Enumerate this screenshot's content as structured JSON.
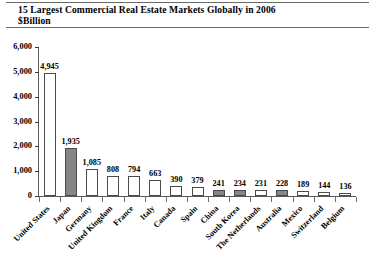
{
  "title": {
    "line1": "15 Largest Commercial Real Estate Markets Globally in 2006",
    "line2": "$Billion"
  },
  "colors": {
    "bar_white": "#ffffff",
    "bar_gray": "#868686",
    "axis": "#5a5a5a",
    "text": "#000000"
  },
  "chart_data": {
    "type": "bar",
    "title": "15 Largest Commercial Real Estate Markets Globally in 2006",
    "subtitle": "$Billion",
    "xlabel": "",
    "ylabel": "",
    "ylim": [
      0,
      6000
    ],
    "yticks": [
      0,
      1000,
      2000,
      3000,
      4000,
      5000,
      6000
    ],
    "ytick_labels": [
      "0",
      "1,000",
      "2,000",
      "3,000",
      "4,000",
      "5,000",
      "6,000"
    ],
    "grid": false,
    "legend": "none",
    "categories": [
      "United States",
      "Japan",
      "Germany",
      "United Kingdom",
      "France",
      "Italy",
      "Canada",
      "Spain",
      "China",
      "South Korea",
      "The Netherlands",
      "Australia",
      "Mexico",
      "Switzerland",
      "Belgium"
    ],
    "values": [
      4945,
      1935,
      1085,
      808,
      794,
      663,
      390,
      379,
      241,
      234,
      231,
      228,
      189,
      144,
      136
    ],
    "value_labels": [
      "4,945",
      "1,935",
      "1,085",
      "808",
      "794",
      "663",
      "390",
      "379",
      "241",
      "234",
      "231",
      "228",
      "189",
      "144",
      "136"
    ],
    "bar_styles": [
      "white",
      "gray",
      "white",
      "white",
      "white",
      "white",
      "white",
      "white",
      "gray",
      "gray",
      "white",
      "gray",
      "white",
      "white",
      "white"
    ]
  }
}
